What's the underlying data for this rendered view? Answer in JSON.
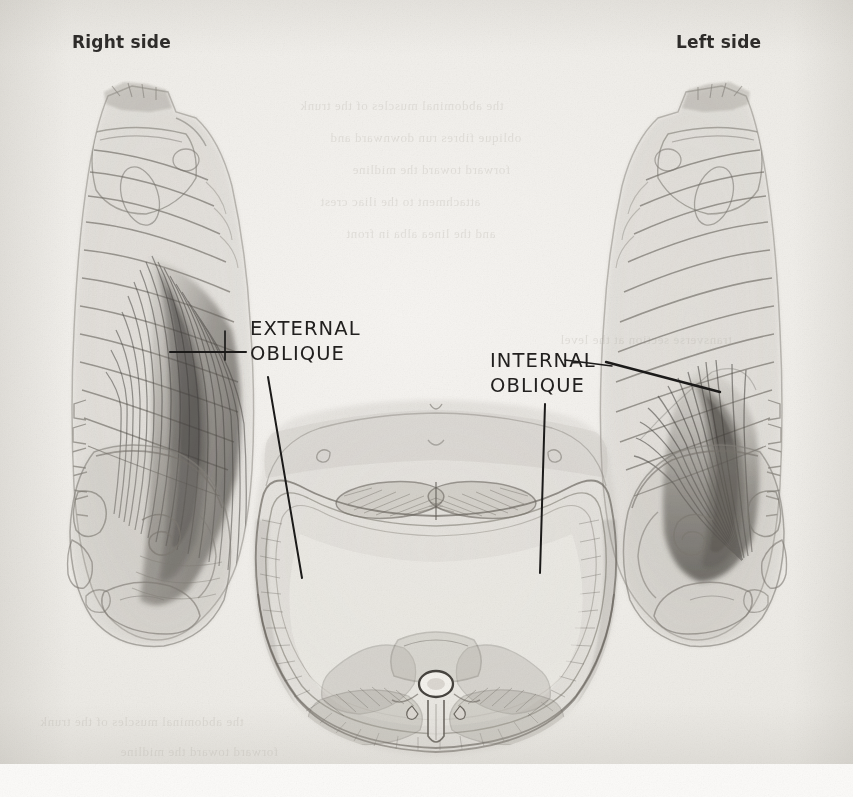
{
  "page": {
    "kind": "scanned-book-plate",
    "width": 853,
    "height": 797,
    "paper_color": "#f1efeb",
    "ink_color": "#1b1a19",
    "drawing_tone": "#9a968f"
  },
  "side_labels": [
    {
      "name": "right-side",
      "text": "Right side",
      "x": 72,
      "y": 32
    },
    {
      "name": "left-side",
      "text": "Left side",
      "x": 676,
      "y": 32
    }
  ],
  "part_labels": [
    {
      "name": "external-oblique",
      "line1": "EXTERNAL",
      "line2": "OBLIQUE",
      "x": 250,
      "y": 316
    },
    {
      "name": "internal-oblique",
      "line1": "INTERNAL",
      "line2": "OBLIQUE",
      "x": 490,
      "y": 348
    }
  ],
  "figures": [
    {
      "name": "right-side-posterior-torso",
      "caption": "Right side",
      "muscle_shown": "EXTERNAL OBLIQUE",
      "contains": [
        "rib-cage",
        "scapula",
        "vertebral-column",
        "pelvis",
        "external-oblique-fibers"
      ]
    },
    {
      "name": "left-side-posterior-torso",
      "caption": "Left side",
      "muscle_shown": "INTERNAL OBLIQUE",
      "contains": [
        "rib-cage",
        "scapula",
        "vertebral-column",
        "pelvis",
        "internal-oblique-fibers"
      ]
    },
    {
      "name": "abdominal-cross-section",
      "caption": "",
      "muscle_shown": "EXTERNAL OBLIQUE / INTERNAL OBLIQUE",
      "contains": [
        "vertebra",
        "spinal-canal",
        "rectus-abdominis",
        "abdominal-wall-layers",
        "erector-spinae"
      ]
    }
  ],
  "showthrough_lines": [
    "the abdominal muscles of the trunk",
    "oblique fibres run downward and",
    "forward toward the midline",
    "attachment to the iliac crest",
    "and the linea alba in front",
    "transverse section at the level"
  ]
}
